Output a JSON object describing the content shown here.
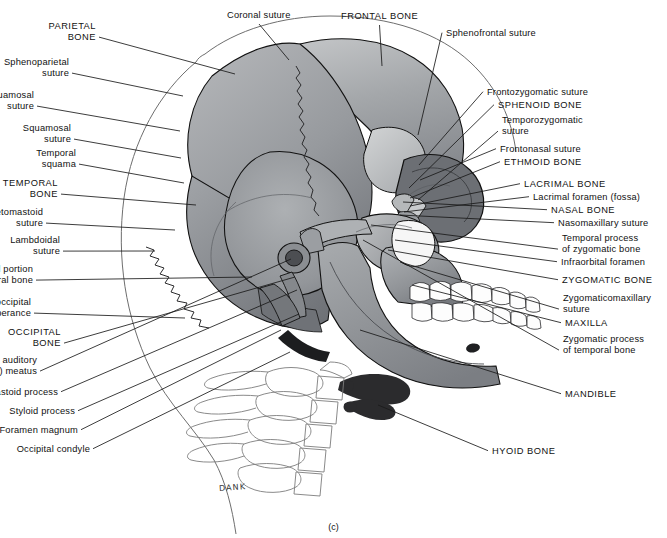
{
  "figure": {
    "caption": "(c)",
    "signature": "DANK"
  },
  "labels_left": [
    {
      "id": "parietal-bone",
      "text": "PARIETAL\nBONE",
      "caps": true,
      "x": 96,
      "y": 21,
      "tip": [
        235,
        74
      ]
    },
    {
      "id": "sphenoparietal-suture",
      "text": "Sphenoparietal\nsuture",
      "caps": false,
      "x": 69,
      "y": 57,
      "tip": [
        183,
        96
      ]
    },
    {
      "id": "sphenosquamosal-suture",
      "text": "Sphenosquamosal\nsuture",
      "caps": false,
      "x": 34,
      "y": 90,
      "tip": [
        180,
        131
      ]
    },
    {
      "id": "squamosal-suture",
      "text": "Squamosal\nsuture",
      "caps": false,
      "x": 71,
      "y": 123,
      "tip": [
        181,
        158
      ]
    },
    {
      "id": "temporal-squama",
      "text": "Temporal\nsquama",
      "caps": false,
      "x": 76,
      "y": 148,
      "tip": [
        184,
        183
      ]
    },
    {
      "id": "temporal-bone",
      "text": "TEMPORAL\nBONE",
      "caps": true,
      "x": 58,
      "y": 178,
      "tip": [
        196,
        205
      ]
    },
    {
      "id": "parietomastoid-suture",
      "text": "Parietomastoid\nsuture",
      "caps": false,
      "x": 43,
      "y": 207,
      "tip": [
        175,
        230
      ]
    },
    {
      "id": "lambdoidal-suture",
      "text": "Lambdoidal\nsuture",
      "caps": false,
      "x": 60,
      "y": 235,
      "tip": [
        155,
        251
      ]
    },
    {
      "id": "mastoid-portion",
      "text": "Mastoid portion\nof temporal bone",
      "caps": false,
      "x": 33,
      "y": 264,
      "tip": [
        252,
        277
      ]
    },
    {
      "id": "external-occipital-prot",
      "text": "External occipital\nprotuberance",
      "caps": false,
      "x": 31,
      "y": 297,
      "tip": [
        185,
        318
      ]
    },
    {
      "id": "occipital-bone",
      "text": "OCCIPITAL\nBONE",
      "caps": true,
      "x": 61,
      "y": 327,
      "tip": [
        295,
        277
      ]
    },
    {
      "id": "external-auditory-meatus",
      "text": "External auditory\n(acoustic) meatus",
      "caps": false,
      "x": 37,
      "y": 355,
      "tip": [
        291,
        259
      ]
    },
    {
      "id": "mastoid-process",
      "text": "Mastoid process",
      "caps": false,
      "x": 58,
      "y": 387,
      "tip": [
        297,
        290
      ]
    },
    {
      "id": "styloid-process",
      "text": "Styloid process",
      "caps": false,
      "x": 75,
      "y": 406,
      "tip": [
        299,
        314
      ]
    },
    {
      "id": "foramen-magnum",
      "text": "Foramen magnum",
      "caps": false,
      "x": 78,
      "y": 425,
      "tip": [
        281,
        330
      ]
    },
    {
      "id": "occipital-condyle",
      "text": "Occipital condyle",
      "caps": false,
      "x": 90,
      "y": 444,
      "tip": [
        290,
        352
      ]
    }
  ],
  "labels_right": [
    {
      "id": "sphenofrontal-suture",
      "text": "Sphenofrontal suture",
      "caps": false,
      "x": 446,
      "y": 28,
      "tip": [
        418,
        135
      ]
    },
    {
      "id": "frontozygomatic-suture",
      "text": "Frontozygomatic suture",
      "caps": false,
      "x": 487,
      "y": 87,
      "tip": [
        419,
        165
      ]
    },
    {
      "id": "sphenoid-bone",
      "text": "SPHENOID BONE",
      "caps": true,
      "x": 498,
      "y": 100,
      "tip": [
        409,
        188
      ]
    },
    {
      "id": "temporozygomatic-suture",
      "text": "Temporozygomatic\nsuture",
      "caps": false,
      "x": 502,
      "y": 115,
      "tip": [
        418,
        200
      ]
    },
    {
      "id": "frontonasal-suture",
      "text": "Frontonasal suture",
      "caps": false,
      "x": 500,
      "y": 144,
      "tip": [
        420,
        180
      ]
    },
    {
      "id": "ethmoid-bone",
      "text": "ETHMOID BONE",
      "caps": true,
      "x": 504,
      "y": 157,
      "tip": [
        410,
        198
      ]
    },
    {
      "id": "lacrimal-bone",
      "text": "LACRIMAL BONE",
      "caps": true,
      "x": 524,
      "y": 179,
      "tip": [
        410,
        206
      ]
    },
    {
      "id": "lacrimal-foramen",
      "text": "Lacrimal foramen (fossa)",
      "caps": false,
      "x": 533,
      "y": 192,
      "tip": [
        404,
        212
      ]
    },
    {
      "id": "nasal-bone",
      "text": "NASAL BONE",
      "caps": true,
      "x": 551,
      "y": 205,
      "tip": [
        403,
        202
      ]
    },
    {
      "id": "nasomaxillary-suture",
      "text": "Nasomaxillary suture",
      "caps": false,
      "x": 558,
      "y": 218,
      "tip": [
        400,
        215
      ]
    },
    {
      "id": "temporal-process-zygo",
      "text": "Temporal process\nof zygomatic bone",
      "caps": false,
      "x": 562,
      "y": 233,
      "tip": [
        371,
        225
      ]
    },
    {
      "id": "infraorbital-foramen",
      "text": "Infraorbital foramen",
      "caps": false,
      "x": 561,
      "y": 257,
      "tip": [
        395,
        240
      ]
    },
    {
      "id": "zygomatic-bone",
      "text": "ZYGOMATIC BONE",
      "caps": true,
      "x": 562,
      "y": 275,
      "tip": [
        388,
        250
      ]
    },
    {
      "id": "zygomaticomaxillary",
      "text": "Zygomaticomaxillary\nsuture",
      "caps": false,
      "x": 563,
      "y": 293,
      "tip": [
        400,
        262
      ]
    },
    {
      "id": "maxilla",
      "text": "MAXILLA",
      "caps": true,
      "x": 565,
      "y": 318,
      "tip": [
        412,
        285
      ]
    },
    {
      "id": "zygomatic-process-temp",
      "text": "Zygomatic process\nof temporal bone",
      "caps": false,
      "x": 563,
      "y": 334,
      "tip": [
        363,
        240
      ]
    },
    {
      "id": "mandible",
      "text": "MANDIBLE",
      "caps": true,
      "x": 565,
      "y": 389,
      "tip": [
        360,
        330
      ]
    },
    {
      "id": "hyoid-bone",
      "text": "HYOID BONE",
      "caps": true,
      "x": 492,
      "y": 446,
      "tip": [
        378,
        405
      ]
    }
  ],
  "labels_top": [
    {
      "id": "coronal-suture",
      "text": "Coronal suture",
      "caps": false,
      "x": 227,
      "y": 10,
      "tip": [
        289,
        60
      ]
    },
    {
      "id": "frontal-bone",
      "text": "FRONTAL BONE",
      "caps": true,
      "x": 341,
      "y": 11,
      "tip": [
        382,
        66
      ]
    }
  ],
  "colors": {
    "ink": "#111111",
    "leader": "#1a1a1a",
    "cranium_light": "#b9bbbd",
    "cranium_mid": "#9b9da0",
    "cranium_dark": "#7c7f84",
    "cranium_deep": "#63666b",
    "face_mid": "#8e9195",
    "face_light": "#c6c8ca",
    "teeth": "#fdfdfd",
    "hyoid": "#2b2b2d",
    "outline": "#111111",
    "soft_tissue_line": "#6e6e6e",
    "vertebra_line": "#777777",
    "background": "#ffffff"
  }
}
